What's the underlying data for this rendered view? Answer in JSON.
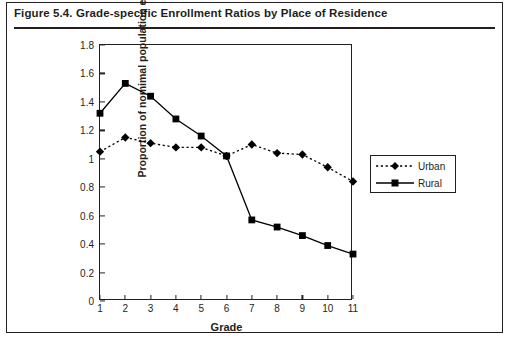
{
  "figure": {
    "title": "Figure 5.4.  Grade-specific Enrollment Ratios by Place of Residence"
  },
  "chart_data": {
    "type": "line",
    "title": "Grade-specific Enrollment Ratios by Place of Residence",
    "xlabel": "Grade",
    "ylabel": "Proportion of nomimal population enrolled",
    "categories": [
      "1",
      "2",
      "3",
      "4",
      "5",
      "6",
      "7",
      "8",
      "9",
      "10",
      "11"
    ],
    "x": [
      1,
      2,
      3,
      4,
      5,
      6,
      7,
      8,
      9,
      10,
      11
    ],
    "xlim": [
      1,
      11
    ],
    "ylim": [
      0,
      1.8
    ],
    "ytick_labels": [
      "0",
      "0.2",
      "0.4",
      "0.6",
      "0.8",
      "1",
      "1.2",
      "1.4",
      "1.6",
      "1.8"
    ],
    "ytick_values": [
      0,
      0.2,
      0.4,
      0.6,
      0.8,
      1.0,
      1.2,
      1.4,
      1.6,
      1.8
    ],
    "grid": false,
    "legend_position": "right",
    "series": [
      {
        "name": "Urban",
        "marker": "diamond",
        "line_style": "dotted",
        "color": "#000000",
        "values": [
          1.05,
          1.15,
          1.11,
          1.08,
          1.08,
          1.02,
          1.1,
          1.04,
          1.03,
          0.94,
          0.84
        ]
      },
      {
        "name": "Rural",
        "marker": "square",
        "line_style": "solid",
        "color": "#000000",
        "values": [
          1.32,
          1.53,
          1.44,
          1.28,
          1.16,
          1.02,
          0.57,
          0.52,
          0.46,
          0.39,
          0.33
        ]
      }
    ]
  }
}
